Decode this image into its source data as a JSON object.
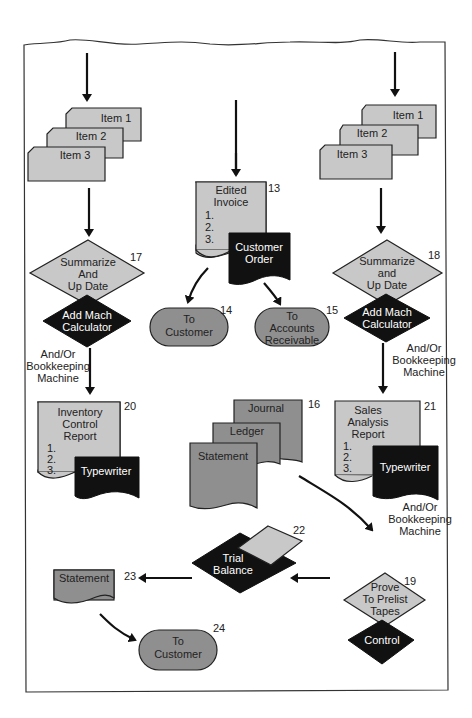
{
  "diagram": {
    "type": "flowchart",
    "colors": {
      "light_fill": "#c8c8c8",
      "medium_fill": "#8f8f8f",
      "dark_fill": "#111111",
      "stroke": "#222222"
    },
    "left_column": {
      "cards": [
        "Item 1",
        "Item 2",
        "Item 3"
      ],
      "decision": {
        "lines": [
          "Summarize",
          "And",
          "Up Date"
        ],
        "number": "17"
      },
      "device": {
        "lines": [
          "Add Mach",
          "Calculator"
        ]
      },
      "note": [
        "And/Or",
        "Bookkeeping",
        "Machine"
      ],
      "report": {
        "lines": [
          "Inventory",
          "Control",
          "Report"
        ],
        "items": [
          "1.",
          "2.",
          "3."
        ],
        "number": "20"
      },
      "report_device": "Typewriter"
    },
    "center_column": {
      "invoice": {
        "lines": [
          "Edited",
          "Invoice"
        ],
        "items": [
          "1.",
          "2.",
          "3."
        ],
        "number": "13"
      },
      "order": {
        "lines": [
          "Customer",
          "Order"
        ]
      },
      "terminal_left": {
        "lines": [
          "To",
          "Customer"
        ],
        "number": "14"
      },
      "terminal_right": {
        "lines": [
          "To",
          "Accounts",
          "Receivable"
        ],
        "number": "15"
      },
      "documents": {
        "items": [
          "Journal",
          "Ledger",
          "Statement"
        ],
        "number": "16"
      },
      "trial_balance": {
        "lines": [
          "Trial",
          "Balance"
        ],
        "number": "22"
      }
    },
    "right_column": {
      "cards": [
        "Item 1",
        "Item 2",
        "Item 3"
      ],
      "decision": {
        "lines": [
          "Summarize",
          "and",
          "Up Date"
        ],
        "number": "18"
      },
      "device": {
        "lines": [
          "Add Mach",
          "Calculator"
        ]
      },
      "note_top": [
        "And/Or",
        "Bookkeeping",
        "Machine"
      ],
      "report": {
        "lines": [
          "Sales",
          "Analysis",
          "Report"
        ],
        "items": [
          "1.",
          "2.",
          "3."
        ],
        "number": "21"
      },
      "report_device": "Typewriter",
      "note_bottom": [
        "And/Or",
        "Bookkeeping",
        "Machine"
      ],
      "prove": {
        "lines": [
          "Prove",
          "To Prelist",
          "Tapes"
        ],
        "number": "19"
      },
      "control": "Control"
    },
    "bottom": {
      "statement": {
        "label": "Statement",
        "number": "23"
      },
      "terminal": {
        "lines": [
          "To",
          "Customer"
        ],
        "number": "24"
      }
    }
  }
}
